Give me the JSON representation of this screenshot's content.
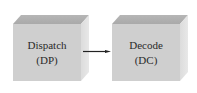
{
  "diagram": {
    "nodes": [
      {
        "id": "dp",
        "label": "Dispatch",
        "abbr": "(DP)"
      },
      {
        "id": "dc",
        "label": "Decode",
        "abbr": "(DC)"
      }
    ],
    "edges": [
      {
        "from": "dp",
        "to": "dc"
      }
    ],
    "colors": {
      "front_face": "#cfcfcf",
      "top_face": "#b0b0b0",
      "side_face": "#e2e2e2",
      "arrow": "#222222",
      "text": "#2a2a2a"
    }
  }
}
